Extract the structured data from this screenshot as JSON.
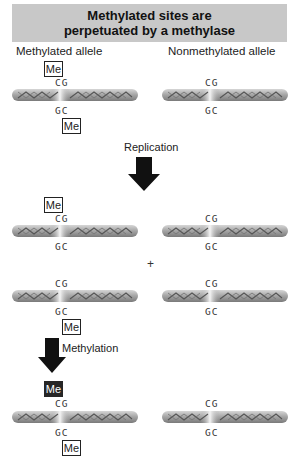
{
  "title": {
    "line1": "Methylated sites are",
    "line2": "perpetuated by a methylase",
    "background": "#c8c8c8"
  },
  "columns": {
    "left": "Methylated allele",
    "right": "Nonmethylated allele"
  },
  "base_pair": {
    "top": "CG",
    "bottom": "GC"
  },
  "methyl_label": "Me",
  "steps": {
    "replication": "Replication",
    "plus": "+",
    "methylation": "Methylation"
  },
  "rows": [
    {
      "stage": "initial",
      "left": {
        "top_me": "open",
        "bottom_me": "open"
      },
      "right": {
        "top_me": "none",
        "bottom_me": "none"
      }
    },
    {
      "stage": "after-replication-1",
      "left": {
        "top_me": "open",
        "bottom_me": "none"
      },
      "right": {
        "top_me": "none",
        "bottom_me": "none"
      }
    },
    {
      "stage": "after-replication-2",
      "left": {
        "top_me": "none",
        "bottom_me": "open"
      },
      "right": {
        "top_me": "none",
        "bottom_me": "none"
      }
    },
    {
      "stage": "after-methylation",
      "left": {
        "top_me": "filled",
        "bottom_me": "open"
      },
      "right": {
        "top_me": "none",
        "bottom_me": "none"
      }
    }
  ],
  "colors": {
    "strand": "#9a9a9a",
    "strand_highlight": "#e6e6e6",
    "arrow": "#111111",
    "new_methyl": "#262626"
  }
}
